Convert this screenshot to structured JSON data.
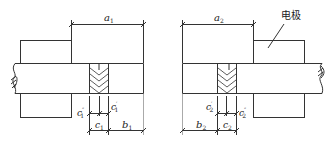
{
  "figure": {
    "left": {
      "dim_a": "a",
      "dim_a_sub": "1",
      "dim_b": "b",
      "dim_b_sub": "1",
      "dim_c": "c",
      "dim_c_sub": "1",
      "dim_c_double_prime": "c",
      "dim_c_double_prime_mark": "″",
      "dim_c_double_prime_sub": "1",
      "dim_c_prime": "c",
      "dim_c_prime_mark": "′",
      "dim_c_prime_sub": "1"
    },
    "right": {
      "dim_a": "a",
      "dim_a_sub": "2",
      "dim_b": "b",
      "dim_b_sub": "2",
      "dim_c": "c",
      "dim_c_sub": "2",
      "dim_c_prime": "c",
      "dim_c_prime_mark": "′",
      "dim_c_prime_sub": "2",
      "dim_c_double_prime": "c",
      "dim_c_double_prime_mark": "″",
      "dim_c_double_prime_sub": "2",
      "electrode_label": "电极"
    },
    "colors": {
      "line": "#333333",
      "text": "#222222"
    }
  }
}
